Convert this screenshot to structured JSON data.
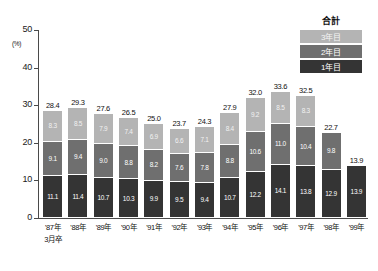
{
  "chart_data": {
    "type": "bar",
    "title": "",
    "xlabel": "",
    "ylabel": "(%)",
    "ylim": [
      0,
      50
    ],
    "ytick_labels": [
      "0",
      "10",
      "20",
      "30",
      "40",
      "50"
    ],
    "grid": false,
    "stacked": true,
    "legend_position": "top-right",
    "legend_title": "合計",
    "categories": [
      "'87年",
      "'88年",
      "'89年",
      "'90年",
      "'91年",
      "'92年",
      "'93年",
      "'94年",
      "'95年",
      "'96年",
      "'97年",
      "'98年",
      "'99年"
    ],
    "category_note": "3月卒",
    "series": [
      {
        "name": "1年目",
        "color": "#343434",
        "values": [
          11.1,
          11.4,
          10.7,
          10.3,
          9.9,
          9.5,
          9.4,
          10.7,
          12.2,
          14.1,
          13.8,
          12.9,
          13.9
        ]
      },
      {
        "name": "2年目",
        "color": "#6f6f6f",
        "values": [
          9.1,
          9.4,
          9.0,
          8.8,
          8.2,
          7.6,
          7.8,
          8.8,
          10.6,
          11.0,
          10.4,
          9.8,
          null
        ]
      },
      {
        "name": "3年目",
        "color": "#b4b4b4",
        "values": [
          8.3,
          8.5,
          7.9,
          7.4,
          6.9,
          6.6,
          7.1,
          8.4,
          9.2,
          8.5,
          8.3,
          null,
          null
        ]
      }
    ],
    "totals": [
      28.4,
      29.3,
      27.6,
      26.5,
      25.0,
      23.7,
      24.3,
      27.9,
      32.0,
      33.6,
      32.5,
      22.7,
      13.9
    ]
  }
}
